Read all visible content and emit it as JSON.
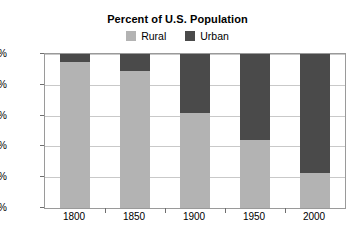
{
  "chart_data": {
    "type": "bar",
    "title": "Percent of U.S. Population",
    "xlabel": "",
    "ylabel": "",
    "categories": [
      "1800",
      "1850",
      "1900",
      "1950",
      "2000"
    ],
    "series": [
      {
        "name": "Rural",
        "values": [
          95,
          89,
          62,
          44,
          23
        ],
        "color": "#b3b3b3"
      },
      {
        "name": "Urban",
        "values": [
          5,
          11,
          38,
          56,
          77
        ],
        "color": "#4a4a4a"
      }
    ],
    "stacked": true,
    "ylim": [
      0,
      100
    ],
    "yticks": [
      0,
      20,
      40,
      60,
      80,
      100
    ],
    "ytick_labels": [
      "0%",
      "20%",
      "40%",
      "60%",
      "80%",
      "100%"
    ],
    "grid": true,
    "legend_position": "top-center"
  },
  "legend": {
    "entries": [
      {
        "label": "Rural",
        "color": "#b3b3b3"
      },
      {
        "label": "Urban",
        "color": "#4a4a4a"
      }
    ]
  },
  "colors": {
    "rural": "#b3b3b3",
    "urban": "#4a4a4a",
    "grid": "#c9c9c9",
    "axis": "#9a9a9a",
    "background": "#ffffff",
    "text": "#000000"
  }
}
